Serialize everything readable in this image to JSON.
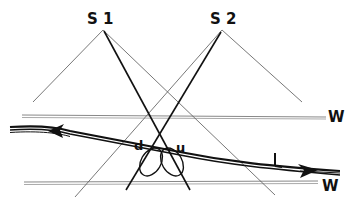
{
  "diagram": {
    "labels": {
      "s1": "S 1",
      "s2": "S 2",
      "w_top": "W",
      "w_bottom": "W",
      "d": "d",
      "u": "u",
      "l": "L"
    },
    "colors": {
      "ink": "#111111",
      "thin_line": "#555555",
      "wall_line": "#888888",
      "background": "#ffffff"
    }
  }
}
